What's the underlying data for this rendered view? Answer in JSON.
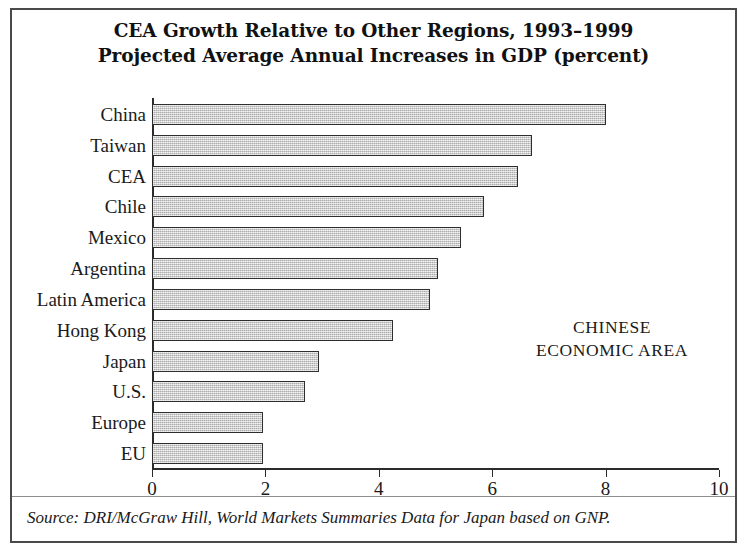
{
  "figure": {
    "annotation_line1": "CHINESE",
    "annotation_line2": "ECONOMIC AREA",
    "source": "Source: DRI/McGraw Hill, World Markets Summaries Data for Japan based on GNP."
  },
  "chart_data": {
    "type": "bar",
    "orientation": "horizontal",
    "title": "CEA Growth Relative to Other Regions, 1993–1999\nProjected Average Annual Increases in GDP (percent)",
    "title_line1": "CEA Growth Relative to Other Regions, 1993–1999",
    "title_line2": "Projected Average Annual Increases in GDP (percent)",
    "xlabel": "",
    "ylabel": "",
    "xlim": [
      0,
      10
    ],
    "grid": false,
    "legend": false,
    "xticks": [
      0,
      2,
      4,
      6,
      8,
      10
    ],
    "xtick_labels": [
      "0",
      "2",
      "4",
      "6",
      "8",
      "10"
    ],
    "categories": [
      "China",
      "Taiwan",
      "CEA",
      "Chile",
      "Mexico",
      "Argentina",
      "Latin America",
      "Hong Kong",
      "Japan",
      "U.S.",
      "Europe",
      "EU"
    ],
    "values": [
      8.0,
      6.7,
      6.45,
      5.85,
      5.45,
      5.05,
      4.9,
      4.25,
      2.95,
      2.7,
      1.95,
      1.95
    ],
    "annotations": [
      "CHINESE ECONOMIC AREA"
    ],
    "colors": {
      "bar_fill": "#c9c9c9",
      "bar_border": "#2e2e2e",
      "axis": "#2b2b2b",
      "frame": "#4a4a4a",
      "text": "#1a1a1a",
      "background": "#ffffff"
    }
  }
}
